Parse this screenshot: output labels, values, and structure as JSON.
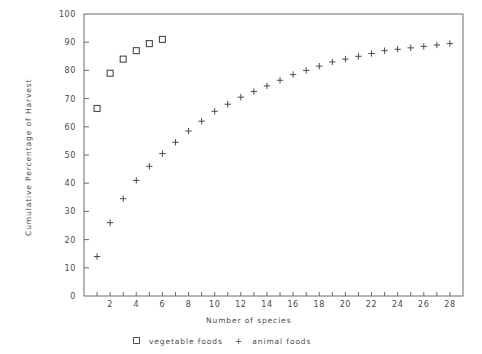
{
  "chart_data": {
    "type": "scatter",
    "title": "",
    "xlabel": "Number of species",
    "ylabel": "Cumulative Percentage of Harvest",
    "xlim": [
      0,
      29
    ],
    "ylim": [
      0,
      100
    ],
    "grid": false,
    "legend_position": "bottom",
    "x_ticks": [
      2,
      4,
      6,
      8,
      10,
      12,
      14,
      16,
      18,
      20,
      22,
      24,
      26,
      28
    ],
    "x_minor_ticks": [
      1,
      2,
      3,
      4,
      5,
      6,
      7,
      8,
      9,
      10,
      11,
      12,
      13,
      14,
      15,
      16,
      17,
      18,
      19,
      20,
      21,
      22,
      23,
      24,
      25,
      26,
      27,
      28
    ],
    "y_ticks": [
      0,
      10,
      20,
      30,
      40,
      50,
      60,
      70,
      80,
      90,
      100
    ],
    "series": [
      {
        "name": "vegetable foods",
        "marker": "square",
        "x": [
          1,
          2,
          3,
          4,
          5,
          6
        ],
        "values": [
          66.5,
          79.0,
          84.0,
          87.0,
          89.5,
          91.0
        ]
      },
      {
        "name": "animal foods",
        "marker": "plus",
        "x": [
          1,
          2,
          3,
          4,
          5,
          6,
          7,
          8,
          9,
          10,
          11,
          12,
          13,
          14,
          15,
          16,
          17,
          18,
          19,
          20,
          21,
          22,
          23,
          24,
          25,
          26,
          27,
          28
        ],
        "values": [
          14.0,
          26.0,
          34.5,
          41.0,
          46.0,
          50.5,
          54.5,
          58.5,
          62.0,
          65.5,
          68.0,
          70.5,
          72.5,
          74.5,
          76.5,
          78.5,
          80.0,
          81.5,
          83.0,
          84.0,
          85.0,
          86.0,
          87.0,
          87.5,
          88.0,
          88.5,
          89.0,
          89.5
        ]
      }
    ]
  },
  "legend": {
    "vegetable_label": "vegetable foods",
    "animal_label": "animal foods",
    "vegetable_marker": "square-marker-icon",
    "animal_marker": "plus-marker-icon"
  },
  "axes": {
    "x_title": "Number of species",
    "y_title": "Cumulative Percentage of Harvest"
  },
  "colors": {
    "marker": "#4a4a4a",
    "axis": "#6b6b6b",
    "background": "#ffffff"
  }
}
